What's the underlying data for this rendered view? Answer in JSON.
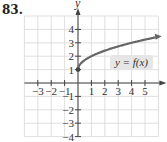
{
  "problem": {
    "number": "83."
  },
  "chart_data": {
    "type": "line",
    "title": "",
    "xlabel": "x",
    "ylabel": "y",
    "xlim": [
      -4,
      6
    ],
    "ylim": [
      -4,
      5
    ],
    "grid": true,
    "x_ticks": [
      -3,
      -2,
      -1,
      1,
      2,
      3,
      4,
      5
    ],
    "y_ticks": [
      4,
      3,
      2,
      1,
      -1,
      -2,
      -3,
      -4
    ],
    "x_tick_labels": [
      "−3",
      "−2",
      "−1",
      "1",
      "2",
      "3",
      "4",
      "5"
    ],
    "y_tick_labels": [
      "4",
      "3",
      "2",
      "1",
      "−1",
      "−2",
      "−3",
      "−4"
    ],
    "series": [
      {
        "name": "y = f(x)",
        "start_point": {
          "x": 0,
          "y": 1,
          "closed": true
        },
        "arrow_end": true,
        "points": [
          {
            "x": 0,
            "y": 1
          },
          {
            "x": 0.25,
            "y": 1.5
          },
          {
            "x": 1,
            "y": 2
          },
          {
            "x": 2,
            "y": 2.41
          },
          {
            "x": 3,
            "y": 2.73
          },
          {
            "x": 4,
            "y": 3
          },
          {
            "x": 5,
            "y": 3.24
          },
          {
            "x": 5.8,
            "y": 3.41
          }
        ]
      }
    ],
    "annotations": [
      {
        "text": "y = f(x)",
        "x": 3.5,
        "y": 1.7
      }
    ],
    "colors": {
      "curve": "#666666",
      "grid": "#d8d8d8",
      "axis": "#444444",
      "label_bg": "#e6e6e6"
    }
  }
}
